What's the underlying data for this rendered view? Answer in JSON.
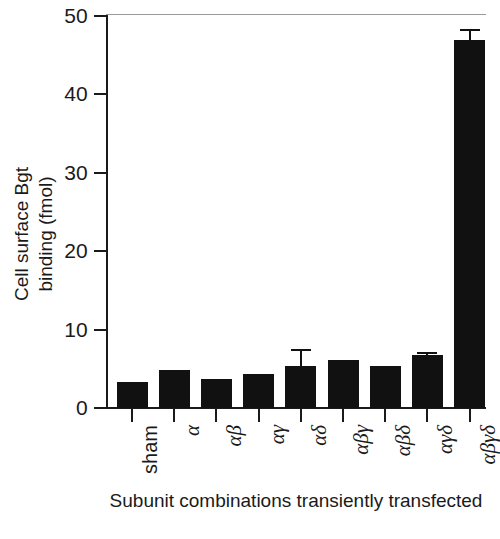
{
  "chart_data": {
    "type": "bar",
    "title": "",
    "xlabel": "Subunit combinations transiently transfected",
    "ylabel": "Cell surface Bgt binding (fmol)",
    "ylabel_lines": [
      "Cell surface Bgt",
      "binding (fmol)"
    ],
    "categories": [
      "sham",
      "α",
      "αβ",
      "αγ",
      "αδ",
      "αβγ",
      "αβδ",
      "αγδ",
      "αβγδ"
    ],
    "values": [
      3.3,
      4.8,
      3.7,
      4.4,
      5.4,
      6.1,
      5.4,
      6.7,
      46.9
    ],
    "errors": [
      0,
      0,
      0,
      0,
      2.1,
      0,
      0,
      0.5,
      1.4
    ],
    "ylim": [
      0,
      50
    ],
    "yticks": [
      0,
      10,
      20,
      30,
      40,
      50
    ],
    "ytick_labels": [
      "0",
      "10",
      "20",
      "30",
      "40",
      "50"
    ],
    "grid": false,
    "legend": null,
    "bar_color": "#111111",
    "axis_color": "#1a1a1a"
  },
  "axes": {
    "x_title": "Subunit combinations transiently transfected",
    "x_title_line1": "Subunit combinations",
    "x_title_line2": "transiently transfected",
    "y_title_line1": "Cell surface Bgt",
    "y_title_line2": "binding (fmol)"
  }
}
